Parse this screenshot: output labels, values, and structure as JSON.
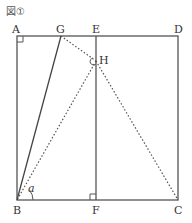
{
  "figure": {
    "caption": "図①",
    "angle_label": "a"
  },
  "points": {
    "A": {
      "label": "A",
      "x": 17,
      "y": 36
    },
    "G": {
      "label": "G",
      "x": 61,
      "y": 36
    },
    "E": {
      "label": "E",
      "x": 96,
      "y": 36
    },
    "D": {
      "label": "D",
      "x": 178,
      "y": 36
    },
    "H": {
      "label": "H",
      "x": 96,
      "y": 61
    },
    "B": {
      "label": "B",
      "x": 17,
      "y": 200
    },
    "F": {
      "label": "F",
      "x": 96,
      "y": 200
    },
    "C": {
      "label": "C",
      "x": 178,
      "y": 200
    }
  },
  "segments": {
    "solid": [
      "AD",
      "DC",
      "CB",
      "BA",
      "EF",
      "GB"
    ],
    "dotted": [
      "GH",
      "HB",
      "HC"
    ]
  },
  "right_angles": [
    "A",
    "F"
  ],
  "colors": {
    "line": "#555555",
    "text": "#333333"
  }
}
